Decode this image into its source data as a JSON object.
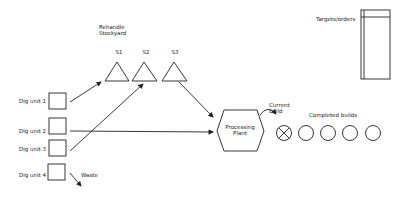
{
  "diagram": {
    "rehandle_label": "Rehandle\nStockyard",
    "rehandle_line1": "Rehandle",
    "rehandle_line2": "Stockyard",
    "stockpiles": [
      {
        "label": "S1"
      },
      {
        "label": "S2"
      },
      {
        "label": "S3"
      }
    ],
    "dig_units": [
      {
        "label": "Dig unit 1"
      },
      {
        "label": "Dig unit 2"
      },
      {
        "label": "Dig unit 3"
      },
      {
        "label": "Dig unit 4"
      }
    ],
    "waste_label": "Waste",
    "plant_line1": "Processing",
    "plant_line2": "Plant",
    "current_build_line1": "Current",
    "current_build_line2": "build",
    "completed_builds_label": "Completed builds",
    "targets_label": "Targets/orders",
    "completed_builds_count": 4,
    "colors": {
      "stroke": "#222222",
      "background": "#ffffff"
    }
  }
}
